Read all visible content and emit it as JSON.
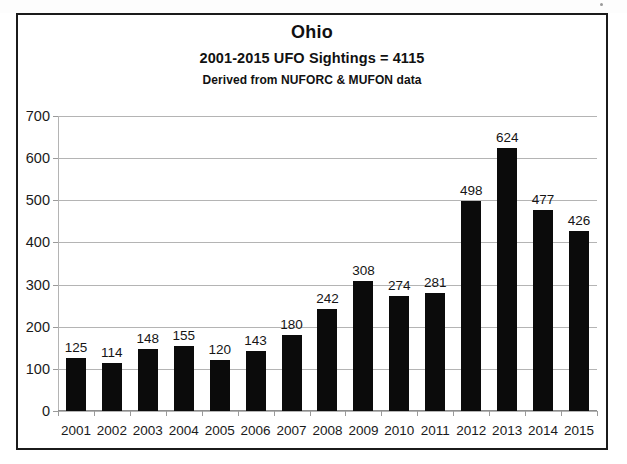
{
  "chart_data": {
    "type": "bar",
    "title": "Ohio",
    "subtitle": "2001-2015  UFO Sightings = 4115",
    "subtitle2": "Derived from NUFORC & MUFON data",
    "xlabel": "",
    "ylabel": "",
    "categories": [
      "2001",
      "2002",
      "2003",
      "2004",
      "2005",
      "2006",
      "2007",
      "2008",
      "2009",
      "2010",
      "2011",
      "2012",
      "2013",
      "2014",
      "2015"
    ],
    "values": [
      125,
      114,
      148,
      155,
      120,
      143,
      180,
      242,
      308,
      274,
      281,
      498,
      624,
      477,
      426
    ],
    "ylim": [
      0,
      700
    ],
    "yticks": [
      0,
      100,
      200,
      300,
      400,
      500,
      600,
      700
    ],
    "ytick_labels": [
      "0",
      "100",
      "200",
      "300",
      "400",
      "500",
      "600",
      "700"
    ],
    "grid": true,
    "legend": "none",
    "data_labels": true,
    "bar_color": "#0b0b0b",
    "grid_color": "#b4b4b4",
    "frame_color": "#1b1b1b",
    "background": "#ffffff"
  }
}
